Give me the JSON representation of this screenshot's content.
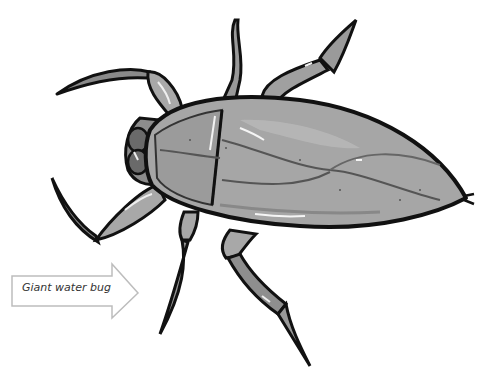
{
  "illustration": {
    "subject": "giant water bug",
    "style": "grayscale cartoon illustration, top view"
  },
  "label": {
    "text": "Giant water bug",
    "pointer": "arrow pointing right toward insect"
  },
  "colors": {
    "outline": "#111111",
    "body_light": "#b8b8b8",
    "body_mid": "#9a9a9a",
    "body_dark": "#7c7c7c",
    "highlight": "#f2f2f2",
    "arrow_stroke": "#bdbdbd"
  }
}
